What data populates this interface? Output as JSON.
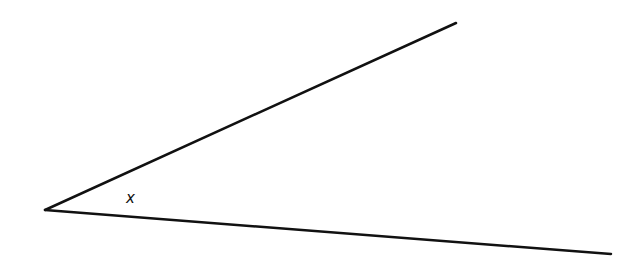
{
  "diagram": {
    "type": "angle",
    "label": "x",
    "stroke_color": "#111111",
    "vertex": [
      45,
      210
    ],
    "ray_upper_end": [
      456,
      23
    ],
    "ray_lower_end": [
      611,
      254
    ],
    "label_position": [
      131,
      202
    ]
  }
}
